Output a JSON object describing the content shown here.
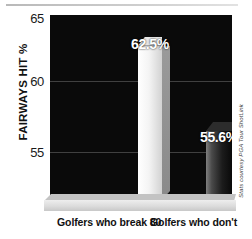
{
  "chart_data": {
    "type": "bar",
    "title": "",
    "subtitle": "",
    "xlabel": "",
    "ylabel": "FAIRWAYS HIT %",
    "categories": [
      "Golfers who break 80",
      "Golfers who don't"
    ],
    "values": [
      62.5,
      55.6
    ],
    "value_labels": [
      "62.5%",
      "55.6%"
    ],
    "ylim": [
      50,
      65
    ],
    "yticks": [
      65,
      60,
      55
    ],
    "ytick_labels": [
      "65",
      "60",
      "55"
    ],
    "grid": true,
    "legend": "none",
    "legend_position": "none",
    "annotations": [
      "Stats courtesy PGA Tour ShotLink"
    ],
    "series": [
      {
        "name": "Fairways hit",
        "values": [
          62.5,
          55.6
        ],
        "colors": [
          "#f2f2f2",
          "#1c1c1c"
        ]
      }
    ],
    "style": {
      "plot_background": "#0a0a0a",
      "figure_background": "#ffffff",
      "gridline_color": "#4a4a4a",
      "value_label_color": "#ffffff",
      "axis_text_color": "#111111",
      "platform_color": "#dcdcdc"
    }
  },
  "axis": {
    "y_label": "FAIRWAYS HIT %",
    "ticks": {
      "t65": "65",
      "t60": "60",
      "t55": "55"
    }
  },
  "bars": {
    "break80": {
      "value_label": "62.5%",
      "category": "Golfers who break 80"
    },
    "dont": {
      "value_label": "55.6%",
      "category": "Golfers who don't"
    }
  },
  "credit": {
    "text": "Stats courtesy PGA Tour ShotLink"
  }
}
